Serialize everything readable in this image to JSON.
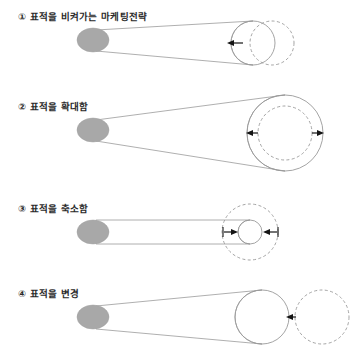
{
  "figure": {
    "background_color": "#ffffff",
    "line_color": "#9a9a9a",
    "blob_color": "#a8a8a8",
    "arrow_color": "#141414",
    "panels": [
      {
        "marker": "①",
        "label": "① 표적을 비켜가는 마케팅전략",
        "shape": "cone",
        "solid_circle": {
          "cx": 253,
          "cy": 43,
          "r": 22
        },
        "dashed_circle": {
          "cx": 272,
          "cy": 43,
          "r": 22
        },
        "arrows": [
          {
            "direction": "left",
            "x_from": 243,
            "x_to": 228,
            "y": 43
          }
        ],
        "source_blob": {
          "cx": 93,
          "cy": 40,
          "rx": 16,
          "ry": 12
        }
      },
      {
        "marker": "②",
        "label": "② 표적을 확대함",
        "shape": "cone",
        "solid_circle": {
          "cx": 285,
          "cy": 133,
          "r": 38
        },
        "dashed_circle": {
          "cx": 285,
          "cy": 133,
          "r": 27
        },
        "arrows": [
          {
            "direction": "left",
            "x_from": 258,
            "x_to": 247,
            "y": 133
          },
          {
            "direction": "right",
            "x_from": 312,
            "x_to": 323,
            "y": 133
          }
        ],
        "source_blob": {
          "cx": 93,
          "cy": 130,
          "rx": 16,
          "ry": 12
        }
      },
      {
        "marker": "③",
        "label": "③ 표적을 축소함",
        "shape": "cylinder",
        "solid_circle": {
          "cx": 250,
          "cy": 232,
          "r": 12
        },
        "dashed_circle": {
          "cx": 250,
          "cy": 232,
          "r": 28
        },
        "arrows": [
          {
            "direction": "right",
            "x_from": 226,
            "x_to": 237,
            "y": 232
          },
          {
            "direction": "left",
            "x_from": 274,
            "x_to": 263,
            "y": 232
          }
        ],
        "source_blob": {
          "cx": 93,
          "cy": 232,
          "rx": 16,
          "ry": 12
        }
      },
      {
        "marker": "④",
        "label": "④ 표적을 변경",
        "shape": "cone",
        "solid_circle": {
          "cx": 262,
          "cy": 317,
          "r": 27
        },
        "dashed_circle": {
          "cx": 322,
          "cy": 317,
          "r": 27
        },
        "arrows": [
          {
            "direction": "left",
            "x_from": 296,
            "x_to": 287,
            "y": 317
          }
        ],
        "source_blob": {
          "cx": 93,
          "cy": 317,
          "rx": 16,
          "ry": 12
        }
      }
    ]
  }
}
